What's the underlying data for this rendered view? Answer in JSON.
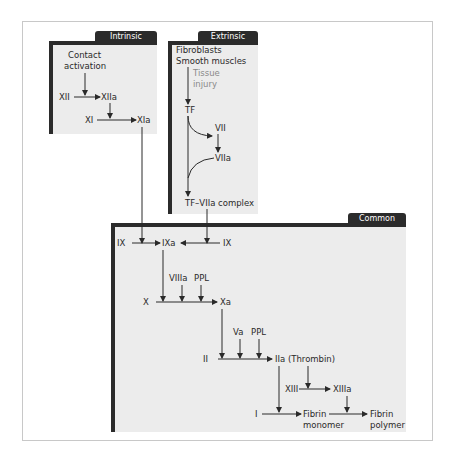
{
  "panels": {
    "intrinsic": {
      "title": "Intrinsic"
    },
    "extrinsic": {
      "title": "Extrinsic"
    },
    "common": {
      "title": "Common"
    }
  },
  "intrinsic": {
    "contact1": "Contact",
    "contact2": "activation",
    "xii": "XII",
    "xiia": "XIIa",
    "xi": "XI",
    "xia": "XIa"
  },
  "extrinsic": {
    "fibroblasts": "Fibroblasts",
    "smooth": "Smooth muscles",
    "tissue1": "Tissue",
    "tissue2": "injury",
    "tf": "TF",
    "vii": "VII",
    "viia": "VIIa",
    "complex": "TF–VIIa complex"
  },
  "common": {
    "ix_left": "IX",
    "ixa": "IXa",
    "ix_right": "IX",
    "viiia": "VIIIa",
    "ppl1": "PPL",
    "x": "X",
    "xa": "Xa",
    "va": "Va",
    "ppl2": "PPL",
    "ii": "II",
    "iia": "IIa (Thrombin)",
    "xiii": "XIII",
    "xiiia": "XIIIa",
    "i": "I",
    "fibrin_mono1": "Fibrin",
    "fibrin_mono2": "monomer",
    "fibrin_poly1": "Fibrin",
    "fibrin_poly2": "polymer"
  }
}
